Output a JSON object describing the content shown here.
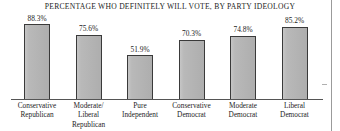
{
  "chart_data": {
    "type": "bar",
    "title": "PERCENTAGE WHO DEFINITELY WILL VOTE, BY PARTY IDEOLOGY",
    "xlabel": "",
    "ylabel": "",
    "ylim": [
      0,
      100
    ],
    "grid": false,
    "legend": "none",
    "categories": [
      "Conservative Republican",
      "Moderate/ Liberal Republican",
      "Pure Independent",
      "Conservative Democrat",
      "Moderate Democrat",
      "Liberal Democrat"
    ],
    "category_lines": [
      [
        "Conservative",
        "Republican"
      ],
      [
        "Moderate/",
        "Liberal",
        "Republican"
      ],
      [
        "Pure",
        "Independent"
      ],
      [
        "Conservative",
        "Democrat"
      ],
      [
        "Moderate",
        "Democrat"
      ],
      [
        "Liberal",
        "Democrat"
      ]
    ],
    "values": [
      88.3,
      75.6,
      51.9,
      70.3,
      74.8,
      85.2
    ],
    "value_labels": [
      "88.3%",
      "75.6%",
      "51.9%",
      "70.3%",
      "74.8%",
      "85.2%"
    ],
    "bar_color": "#b5b5b5",
    "bar_border_color": "#3a3a3a",
    "axis_color": "#555555",
    "text_color": "#1d1d1d"
  }
}
